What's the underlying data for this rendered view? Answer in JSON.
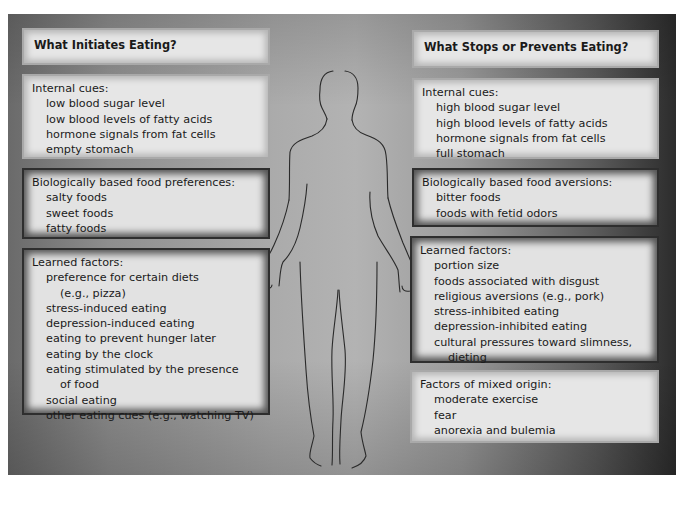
{
  "left": {
    "title": "What Initiates Eating?",
    "internal": {
      "heading": "Internal cues:",
      "items": [
        "low blood sugar level",
        "low blood levels of fatty acids",
        "hormone signals from fat cells",
        "empty stomach"
      ]
    },
    "biological": {
      "heading": "Biologically based food preferences:",
      "items": [
        "salty foods",
        "sweet foods",
        "fatty foods"
      ]
    },
    "learned": {
      "heading": "Learned factors:",
      "lines": [
        {
          "text": "preference for certain diets",
          "cont": false
        },
        {
          "text": "(e.g., pizza)",
          "cont": true
        },
        {
          "text": "stress-induced eating",
          "cont": false
        },
        {
          "text": "depression-induced eating",
          "cont": false
        },
        {
          "text": "eating to prevent hunger later",
          "cont": false
        },
        {
          "text": "eating by the clock",
          "cont": false
        },
        {
          "text": "eating stimulated by the presence",
          "cont": false
        },
        {
          "text": "of food",
          "cont": true
        },
        {
          "text": "social eating",
          "cont": false
        },
        {
          "text": "other eating cues (e.g., watching TV)",
          "cont": false
        }
      ]
    }
  },
  "right": {
    "title": "What Stops or Prevents Eating?",
    "internal": {
      "heading": "Internal cues:",
      "items": [
        "high blood sugar level",
        "high blood levels of fatty acids",
        "hormone signals from fat cells",
        "full stomach"
      ]
    },
    "biological": {
      "heading": "Biologically based food aversions:",
      "items": [
        "bitter foods",
        "foods with fetid odors"
      ]
    },
    "learned": {
      "heading": "Learned factors:",
      "lines": [
        {
          "text": "portion size",
          "cont": false
        },
        {
          "text": "foods associated with disgust",
          "cont": false
        },
        {
          "text": "religious aversions (e.g., pork)",
          "cont": false
        },
        {
          "text": "stress-inhibited eating",
          "cont": false
        },
        {
          "text": "depression-inhibited eating",
          "cont": false
        },
        {
          "text": "cultural pressures toward slimness,",
          "cont": false
        },
        {
          "text": "dieting",
          "cont": true
        }
      ]
    },
    "mixed": {
      "heading": "Factors of mixed origin:",
      "items": [
        "moderate exercise",
        "fear",
        "anorexia and bulemia"
      ]
    }
  },
  "figure": {
    "icon": "human-silhouette-icon"
  },
  "colors": {
    "box_fill": "#e4e4e4",
    "panel_light": "#b3b3b3",
    "panel_dark": "#2c2c2c",
    "text": "#1a1a1a"
  }
}
